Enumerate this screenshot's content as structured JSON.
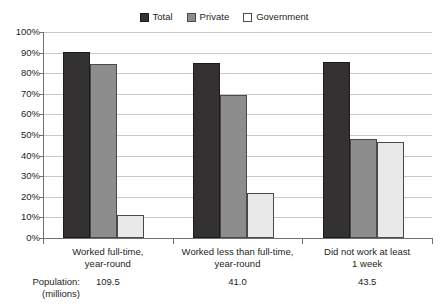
{
  "chart_data": {
    "type": "bar",
    "title": "",
    "xlabel": "",
    "ylabel": "",
    "ylim": [
      0,
      100
    ],
    "ytick_labels": [
      "100%",
      "90%",
      "80%",
      "70%",
      "60%",
      "50%",
      "40%",
      "30%",
      "20%",
      "10%",
      "0%"
    ],
    "ytick_values": [
      100,
      90,
      80,
      70,
      60,
      50,
      40,
      30,
      20,
      10,
      0
    ],
    "grid": true,
    "legend_position": "top-center",
    "categories": [
      {
        "line1": "Worked full-time,",
        "line2": "year-round",
        "population": "109.5"
      },
      {
        "line1": "Worked less than full-time,",
        "line2": "year-round",
        "population": "41.0"
      },
      {
        "line1": "Did not work at least",
        "line2": "1 week",
        "population": "43.5"
      }
    ],
    "series": [
      {
        "name": "Total",
        "color": "#333132",
        "values": [
          90.5,
          85.0,
          85.5
        ]
      },
      {
        "name": "Private",
        "color": "#8d8d8d",
        "values": [
          84.5,
          69.5,
          48.0
        ]
      },
      {
        "name": "Government",
        "color": "#e9e9e9",
        "values": [
          11.0,
          22.0,
          46.5
        ]
      }
    ]
  },
  "legend": {
    "items": [
      {
        "label": "Total",
        "swatch_name": "legend-swatch-total"
      },
      {
        "label": "Private",
        "swatch_name": "legend-swatch-private"
      },
      {
        "label": "Government",
        "swatch_name": "legend-swatch-government"
      }
    ]
  },
  "population_row": {
    "title_line1": "Population:",
    "title_line2": "(millions)",
    "values": [
      "109.5",
      "41.0",
      "43.5"
    ]
  }
}
